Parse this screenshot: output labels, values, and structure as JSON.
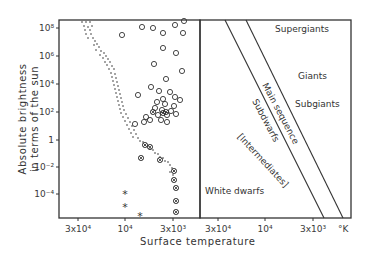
{
  "chart_data": {
    "type": "scatter",
    "title": "",
    "xlabel": "Surface temperature",
    "ylabel": "Absolute brightness in terms of the sun",
    "ylabel_lines": [
      "Absolute brightness",
      "in terms of the sun"
    ],
    "unit_label": "°K",
    "y_ticks": [
      {
        "label": "10⁸",
        "y": 28
      },
      {
        "label": "10⁶",
        "y": 56
      },
      {
        "label": "10⁴",
        "y": 84
      },
      {
        "label": "10²",
        "y": 112
      },
      {
        "label": "1",
        "y": 140
      },
      {
        "label": "10⁻²",
        "y": 167
      },
      {
        "label": "10⁻⁴",
        "y": 194
      }
    ],
    "x_ticks_left": [
      {
        "label": "3x10⁴",
        "x": 78
      },
      {
        "label": "10⁴",
        "x": 125
      },
      {
        "label": "3x10³",
        "x": 173
      }
    ],
    "x_ticks_right": [
      {
        "label": "3x10⁴",
        "x": 218
      },
      {
        "label": "10⁴",
        "x": 265
      },
      {
        "label": "3x10³",
        "x": 313
      }
    ],
    "legend": {
      "dots": "main-sequence stars",
      "open_circles": "giants/supergiants",
      "crossed_circles": "cooler dwarfs",
      "asterisks": "white dwarfs"
    },
    "series": [
      {
        "name": "main sequence (dots)",
        "marker": "dot",
        "points": [
          [
            82,
            22
          ],
          [
            86,
            22
          ],
          [
            90,
            22
          ],
          [
            84,
            26
          ],
          [
            88,
            27
          ],
          [
            92,
            26
          ],
          [
            85,
            30
          ],
          [
            90,
            30
          ],
          [
            86,
            34
          ],
          [
            91,
            34
          ],
          [
            88,
            38
          ],
          [
            93,
            38
          ],
          [
            95,
            41
          ],
          [
            97,
            44
          ],
          [
            94,
            45
          ],
          [
            99,
            47
          ],
          [
            96,
            50
          ],
          [
            101,
            51
          ],
          [
            104,
            53
          ],
          [
            100,
            55
          ],
          [
            106,
            56
          ],
          [
            103,
            58
          ],
          [
            108,
            59
          ],
          [
            105,
            62
          ],
          [
            110,
            62
          ],
          [
            107,
            65
          ],
          [
            112,
            66
          ],
          [
            109,
            69
          ],
          [
            114,
            69
          ],
          [
            111,
            73
          ],
          [
            115,
            74
          ],
          [
            112,
            77
          ],
          [
            116,
            78
          ],
          [
            113,
            81
          ],
          [
            117,
            82
          ],
          [
            114,
            85
          ],
          [
            118,
            86
          ],
          [
            115,
            89
          ],
          [
            119,
            90
          ],
          [
            116,
            93
          ],
          [
            120,
            94
          ],
          [
            117,
            97
          ],
          [
            121,
            98
          ],
          [
            118,
            101
          ],
          [
            122,
            102
          ],
          [
            119,
            105
          ],
          [
            123,
            106
          ],
          [
            120,
            109
          ],
          [
            124,
            110
          ],
          [
            121,
            113
          ],
          [
            126,
            114
          ],
          [
            123,
            117
          ],
          [
            128,
            118
          ],
          [
            125,
            121
          ],
          [
            130,
            122
          ],
          [
            127,
            125
          ],
          [
            132,
            126
          ],
          [
            129,
            129
          ],
          [
            134,
            130
          ],
          [
            131,
            133
          ],
          [
            136,
            134
          ],
          [
            133,
            137
          ],
          [
            138,
            138
          ],
          [
            140,
            141
          ],
          [
            143,
            142
          ],
          [
            145,
            145
          ],
          [
            148,
            146
          ],
          [
            150,
            149
          ],
          [
            153,
            150
          ],
          [
            155,
            153
          ],
          [
            158,
            154
          ],
          [
            160,
            157
          ],
          [
            163,
            158
          ],
          [
            165,
            161
          ],
          [
            168,
            162
          ],
          [
            170,
            165
          ],
          [
            172,
            168
          ],
          [
            174,
            171
          ],
          [
            170,
            172
          ],
          [
            173,
            175
          ]
        ]
      },
      {
        "name": "giants (open circles)",
        "marker": "circle",
        "points": [
          [
            122,
            35
          ],
          [
            142,
            27
          ],
          [
            153,
            28
          ],
          [
            163,
            33
          ],
          [
            175,
            25
          ],
          [
            184,
            21
          ],
          [
            183,
            33
          ],
          [
            163,
            48
          ],
          [
            176,
            53
          ],
          [
            154,
            64
          ],
          [
            182,
            71
          ],
          [
            166,
            79
          ],
          [
            151,
            87
          ],
          [
            138,
            95
          ],
          [
            159,
            91
          ],
          [
            163,
            99
          ],
          [
            170,
            92
          ],
          [
            175,
            97
          ],
          [
            180,
            100
          ],
          [
            157,
            102
          ],
          [
            165,
            104
          ],
          [
            174,
            106
          ],
          [
            155,
            108
          ],
          [
            162,
            110
          ],
          [
            171,
            111
          ],
          [
            158,
            115
          ],
          [
            167,
            115
          ],
          [
            176,
            114
          ],
          [
            161,
            120
          ],
          [
            167,
            122
          ],
          [
            146,
            117
          ],
          [
            150,
            120
          ],
          [
            144,
            122
          ],
          [
            135,
            124
          ]
        ]
      },
      {
        "name": "dwarfs (crossed circles)",
        "marker": "crossed-circle",
        "points": [
          [
            153,
            112
          ],
          [
            166,
            112
          ],
          [
            163,
            113
          ],
          [
            145,
            145
          ],
          [
            150,
            147
          ],
          [
            141,
            158
          ],
          [
            160,
            160
          ],
          [
            174,
            171
          ],
          [
            174,
            180
          ],
          [
            176,
            188
          ],
          [
            176,
            201
          ],
          [
            176,
            212
          ]
        ]
      },
      {
        "name": "white dwarfs (asterisks)",
        "marker": "asterisk",
        "points": [
          [
            125,
            194
          ],
          [
            125,
            207
          ],
          [
            140,
            216
          ]
        ]
      }
    ],
    "panels": [
      "observed data",
      "classification scheme"
    ],
    "regions": [
      {
        "label": "Supergiants",
        "x": 275,
        "y": 32,
        "rotate": 0
      },
      {
        "label": "Giants",
        "x": 298,
        "y": 79,
        "rotate": 0
      },
      {
        "label": "Subgiants",
        "x": 295,
        "y": 107,
        "rotate": 0
      },
      {
        "label": "Main sequence",
        "x": 262,
        "y": 85,
        "rotate": 62
      },
      {
        "label": "Subdwarfs",
        "x": 252,
        "y": 101,
        "rotate": 62
      },
      {
        "label": "[Intermediates]",
        "x": 237,
        "y": 137,
        "rotate": 47
      },
      {
        "label": "White dwarfs",
        "x": 205,
        "y": 194,
        "rotate": 0
      }
    ],
    "bands": [
      {
        "x1": 225,
        "y1": 20,
        "x2": 324,
        "y2": 218
      },
      {
        "x1": 246,
        "y1": 20,
        "x2": 343,
        "y2": 218
      }
    ]
  }
}
